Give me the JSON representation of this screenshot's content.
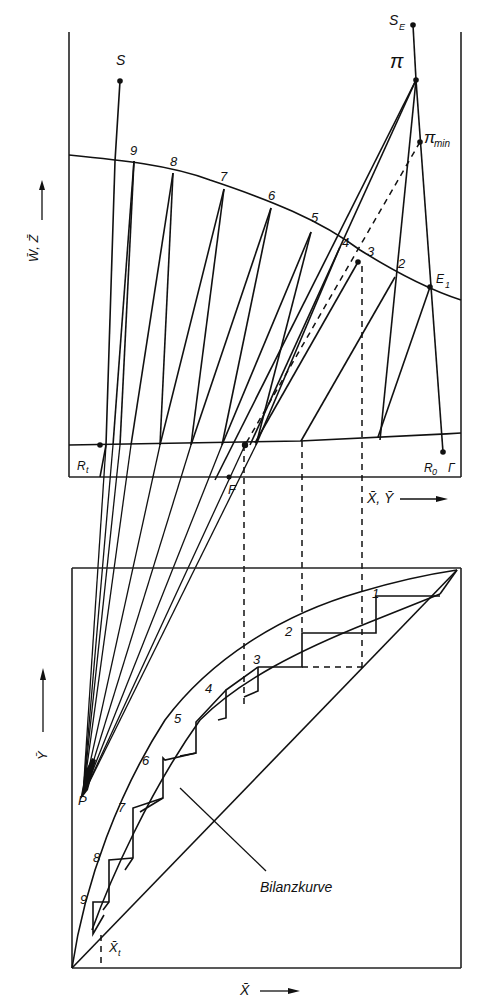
{
  "diagram": {
    "type": "Ponchon-Savarit / McCabe-Thiele combined construction (extraction / rectification stages)",
    "upper_panel": {
      "y_axis_label": "W̄, Z̄",
      "x_axis_label": "X̄, Ȳ",
      "points": {
        "S": "S",
        "S_E": "S",
        "S_E_sub": "E",
        "pi": "π",
        "pi_min": "π",
        "pi_min_sub": "min",
        "E1": "E",
        "E1_sub": "1",
        "Rt": "R",
        "Rt_sub": "t",
        "R0": "R",
        "R0_sub": "0",
        "R0_suffix": "Γ",
        "F": "F"
      },
      "stage_labels": [
        "9",
        "8",
        "7",
        "6",
        "5",
        "4",
        "3",
        "2"
      ]
    },
    "lower_panel": {
      "y_axis_label": "Ȳ",
      "x_axis_label": "X̄",
      "points": {
        "P": "P",
        "Xt": "X̄",
        "Xt_sub": "t"
      },
      "stage_labels": [
        "1",
        "2",
        "3",
        "4",
        "5",
        "6",
        "7",
        "8",
        "9"
      ],
      "curve_label": "Bilanzkurve"
    },
    "colors": {
      "ink": "#111111",
      "background": "#ffffff"
    }
  }
}
